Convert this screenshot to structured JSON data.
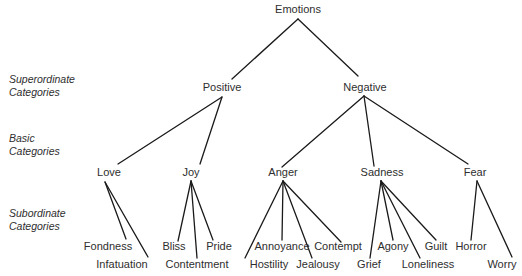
{
  "diagram": {
    "type": "hierarchy-tree",
    "root": "Emotions",
    "level_labels": [
      {
        "line1": "Superordinate",
        "line2": "Categories"
      },
      {
        "line1": "Basic",
        "line2": "Categories"
      },
      {
        "line1": "Subordinate",
        "line2": "Categories"
      }
    ],
    "superordinate": [
      "Positive",
      "Negative"
    ],
    "basic": [
      "Love",
      "Joy",
      "Anger",
      "Sadness",
      "Fear"
    ],
    "subordinate": {
      "love": [
        "Fondness",
        "Infatuation"
      ],
      "joy": [
        "Bliss",
        "Contentment",
        "Pride"
      ],
      "anger": [
        "Hostility",
        "Annoyance",
        "Jealousy",
        "Contempt"
      ],
      "sadness": [
        "Grief",
        "Agony",
        "Loneliness",
        "Guilt"
      ],
      "fear": [
        "Horror",
        "Worry"
      ]
    },
    "line_color": "#1a1a1a"
  }
}
